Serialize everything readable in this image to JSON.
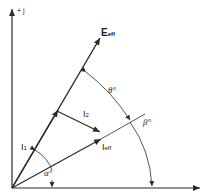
{
  "diagram": {
    "axes": {
      "vertical_label": "+ j",
      "horizontal_label": "+"
    },
    "vectors": [
      {
        "name": "E_eff",
        "label_main": "E",
        "label_sub": "eff"
      },
      {
        "name": "I_1",
        "label_main": "I",
        "label_sub": "1"
      },
      {
        "name": "I_2",
        "label_main": "I",
        "label_sub": "2"
      },
      {
        "name": "I_eff",
        "label_main": "I",
        "label_sub": "eff"
      }
    ],
    "angles": {
      "theta": "θ°",
      "beta_upper": "β°",
      "beta_lower": "β°",
      "alpha": "α°"
    },
    "colors": {
      "line": "#2a2a2a",
      "background": "#ffffff"
    }
  }
}
